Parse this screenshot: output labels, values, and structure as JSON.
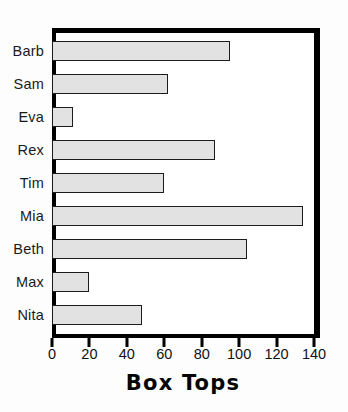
{
  "chart_data": {
    "type": "bar",
    "orientation": "horizontal",
    "title": "",
    "xlabel": "Box Tops",
    "ylabel": "",
    "categories": [
      "Barb",
      "Sam",
      "Eva",
      "Rex",
      "Tim",
      "Mia",
      "Beth",
      "Max",
      "Nita"
    ],
    "values": [
      95,
      62,
      11,
      87,
      60,
      134,
      104,
      20,
      48
    ],
    "xlim": [
      0,
      140
    ],
    "xticks": [
      0,
      20,
      40,
      60,
      80,
      100,
      120,
      140
    ],
    "xtick_labels": [
      "0",
      "20",
      "40",
      "60",
      "80",
      "100",
      "120",
      "140"
    ],
    "grid": false,
    "legend": false,
    "colors": {
      "bar_fill": "#e2e2e2",
      "bar_outline": "#1c1c1c",
      "frame": "#000000",
      "background": "#ffffff",
      "text": "#111111"
    }
  }
}
